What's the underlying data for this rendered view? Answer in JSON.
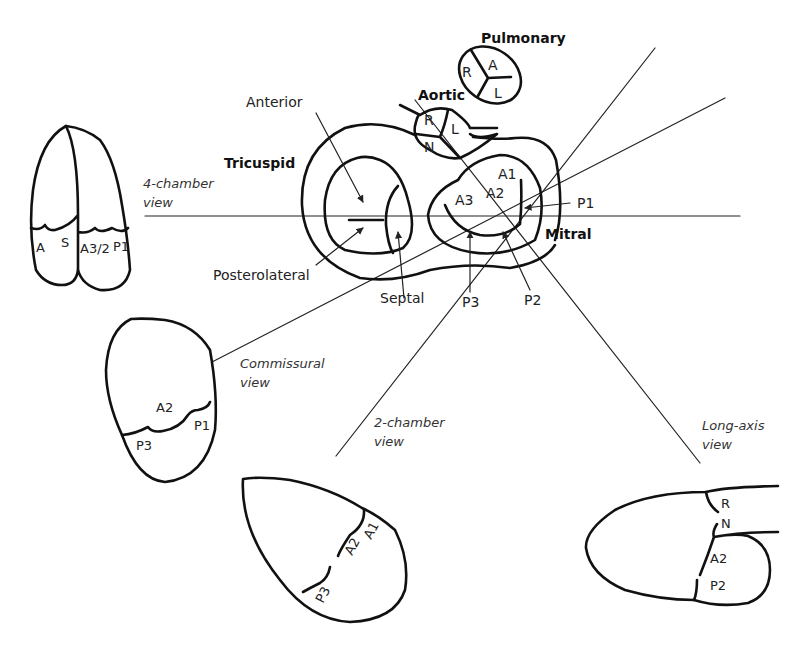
{
  "valves": {
    "pulmonary": {
      "title": "Pulmonary",
      "cusps": [
        "R",
        "A",
        "L"
      ]
    },
    "aortic": {
      "title": "Aortic",
      "cusps": [
        "R",
        "L",
        "N"
      ]
    },
    "tricuspid": {
      "title": "Tricuspid",
      "leaflets": {
        "anterior": "Anterior",
        "posterolateral": "Posterolateral",
        "septal": "Septal"
      }
    },
    "mitral": {
      "title": "Mitral",
      "segments": {
        "a1": "A1",
        "a2": "A2",
        "a3": "A3",
        "p1": "P1",
        "p2": "P2",
        "p3": "P3"
      }
    }
  },
  "views": {
    "four_chamber": {
      "label_line1": "4-chamber",
      "label_line2": "view",
      "segments": [
        "A",
        "S",
        "A3/2",
        "P1"
      ]
    },
    "commissural": {
      "label_line1": "Commissural",
      "label_line2": "view",
      "segments": [
        "A2",
        "P1",
        "P3"
      ]
    },
    "two_chamber": {
      "label_line1": "2-chamber",
      "label_line2": "view",
      "segments": [
        "A2",
        "A1",
        "P3"
      ]
    },
    "long_axis": {
      "label_line1": "Long-axis",
      "label_line2": "view",
      "segments": [
        "R",
        "N",
        "A2",
        "P2"
      ]
    }
  },
  "colors": {
    "stroke": "#111111",
    "background": "#ffffff"
  }
}
